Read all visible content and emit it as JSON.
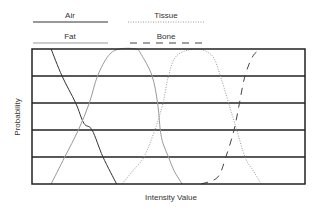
{
  "chart_data": {
    "type": "line",
    "title": "",
    "xlabel": "Intensity Value",
    "ylabel": "Probability",
    "grid": true,
    "gridlines_y": 4,
    "legend_position": "top",
    "legend": [
      {
        "name": "Air",
        "style": "solid",
        "color": "#333333"
      },
      {
        "name": "Tissue",
        "style": "dotted",
        "color": "#999999"
      },
      {
        "name": "Fat",
        "style": "solid",
        "color": "#999999"
      },
      {
        "name": "Bone",
        "style": "dashed",
        "color": "#444444"
      }
    ],
    "xlim": [
      0,
      100
    ],
    "ylim": [
      0,
      1
    ],
    "series": [
      {
        "name": "Air",
        "style": "solid",
        "color": "#333333",
        "x": [
          7,
          11,
          16,
          19,
          22,
          26,
          31
        ],
        "y": [
          1.0,
          0.8,
          0.6,
          0.45,
          0.4,
          0.2,
          0.0
        ]
      },
      {
        "name": "Fat",
        "style": "solid",
        "color": "#999999",
        "x": [
          7,
          12,
          17,
          21,
          24,
          28,
          32,
          38,
          40,
          44,
          46,
          47,
          48,
          50,
          52,
          55
        ],
        "y": [
          0.0,
          0.2,
          0.4,
          0.6,
          0.8,
          0.95,
          1.0,
          1.0,
          0.96,
          0.8,
          0.6,
          0.4,
          0.3,
          0.2,
          0.1,
          0.0
        ]
      },
      {
        "name": "Tissue",
        "style": "dotted",
        "color": "#999999",
        "x": [
          33,
          37,
          41,
          45,
          48,
          50,
          53,
          60,
          66,
          69,
          72,
          75,
          78,
          81,
          84
        ],
        "y": [
          0.0,
          0.1,
          0.2,
          0.4,
          0.6,
          0.8,
          0.95,
          1.0,
          0.95,
          0.8,
          0.6,
          0.4,
          0.2,
          0.1,
          0.0
        ]
      },
      {
        "name": "Bone",
        "style": "dashed",
        "color": "#444444",
        "x": [
          62,
          68,
          71,
          74,
          76,
          78,
          81,
          84
        ],
        "y": [
          0.0,
          0.05,
          0.2,
          0.4,
          0.6,
          0.8,
          0.95,
          1.0
        ]
      }
    ]
  },
  "plot": {
    "left": 32,
    "top": 49,
    "right": 305,
    "bottom": 184
  }
}
